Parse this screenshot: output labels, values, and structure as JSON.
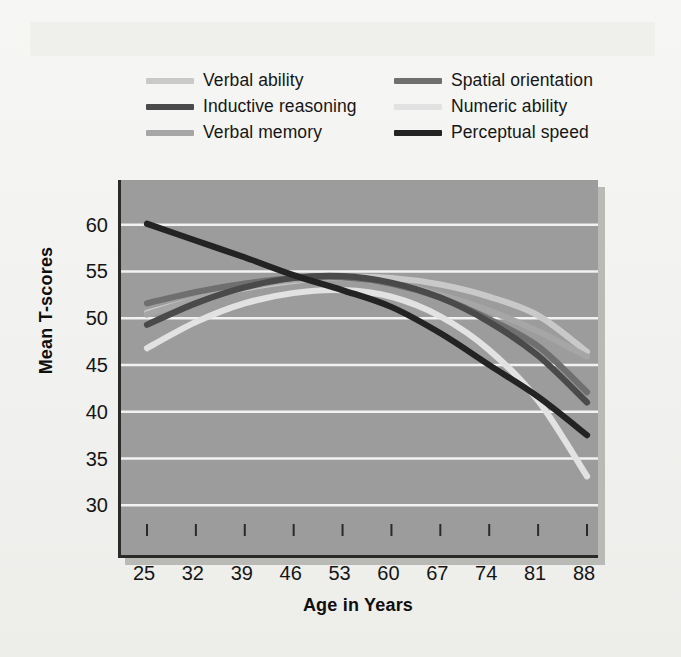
{
  "chart_data": {
    "type": "line",
    "title": "",
    "xlabel": "Age in Years",
    "ylabel": "Mean T-scores",
    "x": [
      25,
      32,
      39,
      46,
      53,
      60,
      67,
      74,
      81,
      88
    ],
    "xlim": [
      25,
      88
    ],
    "ylim": [
      28,
      62
    ],
    "yticks": [
      30,
      35,
      40,
      45,
      50,
      55,
      60
    ],
    "xticks": [
      25,
      32,
      39,
      46,
      53,
      60,
      67,
      74,
      81,
      88
    ],
    "grid": "horizontal",
    "legend_position": "above-plot",
    "plot_background": "#9c9c9c",
    "gridline_color": "#f2f2f2",
    "series": [
      {
        "name": "Verbal ability",
        "color": "#c9c9c9",
        "values": [
          50.6,
          52.0,
          53.2,
          54.0,
          54.4,
          54.3,
          53.6,
          52.3,
          50.3,
          46.4
        ]
      },
      {
        "name": "Spatial orientation",
        "color": "#6f6f6f",
        "values": [
          51.6,
          52.8,
          53.7,
          54.3,
          54.4,
          53.7,
          52.2,
          49.9,
          47.0,
          42.1
        ]
      },
      {
        "name": "Inductive reasoning",
        "color": "#4a4a4a",
        "values": [
          49.3,
          51.6,
          53.3,
          54.3,
          54.5,
          53.8,
          52.2,
          49.6,
          46.0,
          41.0
        ]
      },
      {
        "name": "Numeric ability",
        "color": "#e2e2e2",
        "values": [
          46.8,
          49.6,
          51.6,
          52.7,
          53.0,
          52.3,
          50.2,
          46.6,
          41.2,
          33.1
        ]
      },
      {
        "name": "Verbal memory",
        "color": "#a6a6a6",
        "values": [
          50.4,
          52.0,
          53.3,
          54.1,
          54.3,
          53.7,
          52.5,
          50.8,
          48.6,
          45.9
        ]
      },
      {
        "name": "Perceptual speed",
        "color": "#232323",
        "values": [
          60.1,
          58.3,
          56.5,
          54.6,
          53.0,
          51.2,
          48.4,
          45.0,
          41.6,
          37.5
        ]
      }
    ]
  },
  "legend": {
    "columns": [
      {
        "items": [
          {
            "label": "Verbal ability",
            "series": "Verbal ability"
          },
          {
            "label": "Inductive reasoning",
            "series": "Inductive reasoning"
          },
          {
            "label": "Verbal memory",
            "series": "Verbal memory"
          }
        ]
      },
      {
        "items": [
          {
            "label": "Spatial orientation",
            "series": "Spatial orientation"
          },
          {
            "label": "Numeric ability",
            "series": "Numeric ability"
          },
          {
            "label": "Perceptual speed",
            "series": "Perceptual speed"
          }
        ]
      }
    ]
  }
}
